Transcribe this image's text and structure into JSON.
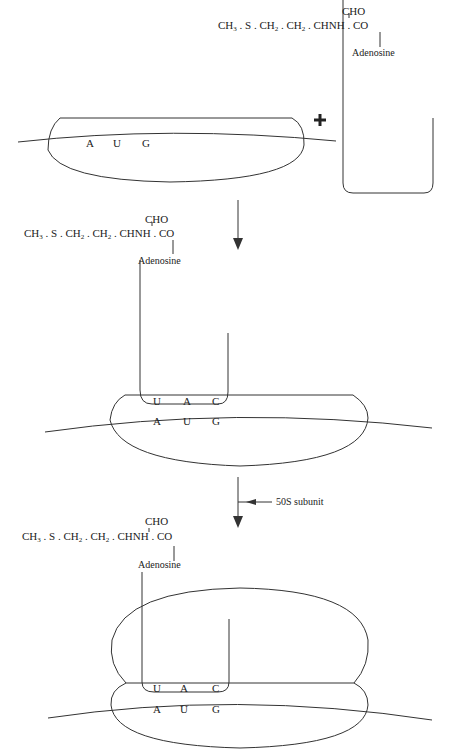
{
  "diagram": {
    "type": "initiation of protein synthesis",
    "plus_sign": "+",
    "molecule": {
      "formyl_group": "CHO",
      "chain_parts": [
        "CH",
        "3",
        " . S . CH",
        "2",
        " . CH",
        "2",
        " . CHNH . CO"
      ],
      "formula_text": "CH3 . S . CH2 . CH2 . CHNH . CO",
      "linker": "Adenosine"
    },
    "mrna_codon": [
      "A",
      "U",
      "G"
    ],
    "trna_anticodon": [
      "U",
      "A",
      "C"
    ],
    "stage_arrow_label": "50S  subunit",
    "stages": [
      {
        "id": 1,
        "description": "30S subunit bound to mRNA with AUG codon, plus formylmethionyl-tRNA"
      },
      {
        "id": 2,
        "description": "tRNA anticodon UAC paired with AUG codon on 30S subunit"
      },
      {
        "id": 3,
        "description": "50S subunit joins to form 70S initiation complex"
      }
    ]
  }
}
